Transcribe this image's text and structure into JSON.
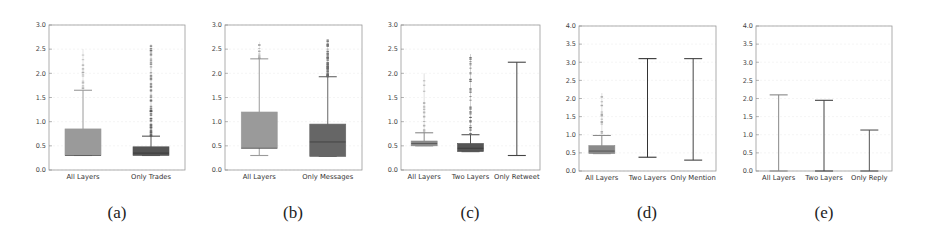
{
  "figure": {
    "captions": [
      "(a)",
      "(b)",
      "(c)",
      "(d)",
      "(e)"
    ]
  },
  "chart_data": [
    {
      "type": "box",
      "caption": "(a)",
      "ylim": [
        0,
        3.0
      ],
      "yticks": [
        "0.0",
        "0.5",
        "1.0",
        "1.5",
        "2.0",
        "2.5",
        "3.0"
      ],
      "grid": true,
      "frame": {
        "left": 49,
        "right": 185,
        "top": 25,
        "bottom": 170
      },
      "categories": [
        "All Layers",
        "Only Trades"
      ],
      "series": [
        {
          "name": "All Layers",
          "whisker_low": 0.3,
          "q1": 0.3,
          "median": 0.3,
          "q3": 0.85,
          "whisker_high": 1.65,
          "outliers_max": 2.5,
          "outlier_density": "sparse",
          "color": "#9a9a9a"
        },
        {
          "name": "Only Trades",
          "whisker_low": 0.3,
          "q1": 0.3,
          "median": 0.35,
          "q3": 0.48,
          "whisker_high": 0.7,
          "outliers_max": 2.6,
          "outlier_density": "dense",
          "color": "#555555"
        }
      ]
    },
    {
      "type": "box",
      "caption": "(b)",
      "ylim": [
        0,
        3.0
      ],
      "yticks": [
        "0.0",
        "0.5",
        "1.0",
        "1.5",
        "2.0",
        "2.5",
        "3.0"
      ],
      "grid": true,
      "frame": {
        "left": 225,
        "right": 362,
        "top": 25,
        "bottom": 170
      },
      "categories": [
        "All Layers",
        "Only Messages"
      ],
      "series": [
        {
          "name": "All Layers",
          "whisker_low": 0.3,
          "q1": 0.45,
          "median": 0.45,
          "q3": 1.2,
          "whisker_high": 2.3,
          "outliers_max": 2.65,
          "outlier_density": "sparse",
          "color": "#9a9a9a"
        },
        {
          "name": "Only Messages",
          "whisker_low": 0.28,
          "q1": 0.28,
          "median": 0.58,
          "q3": 0.95,
          "whisker_high": 1.93,
          "outliers_max": 2.7,
          "outlier_density": "dense",
          "color": "#666666"
        }
      ]
    },
    {
      "type": "box",
      "caption": "(c)",
      "ylim": [
        0,
        3.0
      ],
      "yticks": [
        "0.0",
        "0.5",
        "1.0",
        "1.5",
        "2.0",
        "2.5",
        "3.0"
      ],
      "grid": true,
      "frame": {
        "left": 401,
        "right": 540,
        "top": 25,
        "bottom": 170
      },
      "categories": [
        "All Layers",
        "Two Layers",
        "Only Retweet"
      ],
      "series": [
        {
          "name": "All Layers",
          "whisker_low": 0.5,
          "q1": 0.5,
          "median": 0.55,
          "q3": 0.6,
          "whisker_high": 0.77,
          "outliers_max": 2.0,
          "outlier_density": "sparse",
          "color": "#8a8a8a"
        },
        {
          "name": "Two Layers",
          "whisker_low": 0.38,
          "q1": 0.38,
          "median": 0.45,
          "q3": 0.55,
          "whisker_high": 0.73,
          "outliers_max": 2.4,
          "outlier_density": "medium",
          "color": "#555555"
        },
        {
          "name": "Only Retweet",
          "whisker_low": 0.3,
          "q1": 0.3,
          "median": 0.3,
          "q3": 0.3,
          "whisker_high": 2.23,
          "outliers_max": null,
          "outlier_density": "none",
          "color": "#444444"
        }
      ]
    },
    {
      "type": "box",
      "caption": "(d)",
      "ylim": [
        0,
        4.0
      ],
      "yticks": [
        "0.0",
        "0.5",
        "1.0",
        "1.5",
        "2.0",
        "2.5",
        "3.0",
        "3.5",
        "4.0"
      ],
      "grid": true,
      "frame": {
        "left": 579,
        "right": 716,
        "top": 26,
        "bottom": 171
      },
      "categories": [
        "All Layers",
        "Two Layers",
        "Only Mention"
      ],
      "series": [
        {
          "name": "All Layers",
          "whisker_low": 0.48,
          "q1": 0.48,
          "median": 0.55,
          "q3": 0.7,
          "whisker_high": 0.98,
          "outliers_max": 2.15,
          "outlier_density": "sparse",
          "color": "#8a8a8a"
        },
        {
          "name": "Two Layers",
          "whisker_low": 0.38,
          "q1": 0.38,
          "median": 0.38,
          "q3": 0.38,
          "whisker_high": 3.1,
          "outliers_max": null,
          "outlier_density": "none",
          "color": "#333333"
        },
        {
          "name": "Only Mention",
          "whisker_low": 0.3,
          "q1": 0.3,
          "median": 0.3,
          "q3": 0.3,
          "whisker_high": 3.1,
          "outliers_max": null,
          "outlier_density": "none",
          "color": "#444444"
        }
      ]
    },
    {
      "type": "box",
      "caption": "(e)",
      "ylim": [
        0,
        4.0
      ],
      "yticks": [
        "0.0",
        "0.5",
        "1.0",
        "1.5",
        "2.0",
        "2.5",
        "3.0",
        "3.5",
        "4.0"
      ],
      "grid": true,
      "frame": {
        "left": 756,
        "right": 892,
        "top": 26,
        "bottom": 171
      },
      "categories": [
        "All Layers",
        "Two Layers",
        "Only Reply"
      ],
      "series": [
        {
          "name": "All Layers",
          "whisker_low": 0.0,
          "q1": 0.0,
          "median": 0.0,
          "q3": 0.0,
          "whisker_high": 2.1,
          "outliers_max": null,
          "outlier_density": "none",
          "color": "#888888"
        },
        {
          "name": "Two Layers",
          "whisker_low": 0.0,
          "q1": 0.0,
          "median": 0.0,
          "q3": 0.0,
          "whisker_high": 1.95,
          "outliers_max": null,
          "outlier_density": "none",
          "color": "#444444"
        },
        {
          "name": "Only Reply",
          "whisker_low": 0.0,
          "q1": 0.0,
          "median": 0.0,
          "q3": 0.0,
          "whisker_high": 1.13,
          "outliers_max": null,
          "outlier_density": "none",
          "color": "#555555"
        }
      ]
    }
  ]
}
